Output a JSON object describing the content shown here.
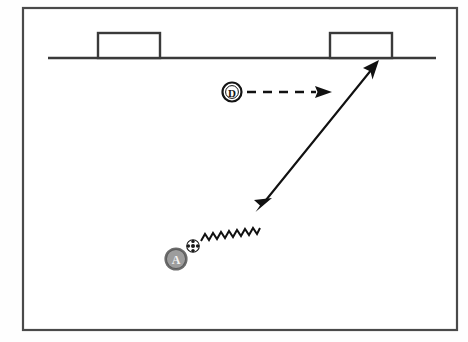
{
  "diagram": {
    "background_color": "#ffffff",
    "frame": {
      "name": "diagram-border",
      "x": 22,
      "y": 7,
      "width": 436,
      "height": 324,
      "stroke_color": "#4a4a4a"
    },
    "field": {
      "line_label": "goal-line",
      "line_color": "#3a3a3a",
      "line_x1": 48,
      "line_x2": 436,
      "line_y": 58,
      "goals": [
        {
          "name": "goal-left",
          "label": "Goal",
          "x": 98,
          "y": 33,
          "width": 62,
          "height": 25
        },
        {
          "name": "goal-right",
          "label": "Goal",
          "x": 330,
          "y": 33,
          "width": 62,
          "height": 25
        }
      ]
    },
    "players": [
      {
        "id": "A",
        "name": "attacker-marker-a",
        "role": "Attacker",
        "fill_color": "#9d9d9d",
        "label_color": "#f2f2f2",
        "cx": 176,
        "cy": 259,
        "r": 11
      },
      {
        "id": "D",
        "name": "defender-marker-d",
        "role": "Defender",
        "fill_color": "#ffffff",
        "label_color": "#141414",
        "cx": 232,
        "cy": 92,
        "r": 9
      }
    ],
    "ball": {
      "name": "soccer-ball-icon",
      "cx": 193,
      "cy": 246,
      "r": 6.2,
      "fill_color": "#ffffff",
      "patch_color": "#1a1a1a"
    },
    "movements": [
      {
        "name": "dribble-path-wavy",
        "type": "dribble",
        "style": "zigzag",
        "color": "#111111",
        "from_x": 200,
        "from_y": 240,
        "to_x": 266,
        "to_y": 201
      },
      {
        "name": "shot-pass-arrow",
        "type": "pass",
        "style": "solid",
        "color": "#111111",
        "from_x": 266,
        "from_y": 200,
        "to_x": 378,
        "to_y": 62
      },
      {
        "name": "defender-run-arrow",
        "type": "run",
        "style": "dashed",
        "color": "#111111",
        "from_x": 247,
        "from_y": 92,
        "to_x": 321,
        "to_y": 92
      }
    ]
  }
}
